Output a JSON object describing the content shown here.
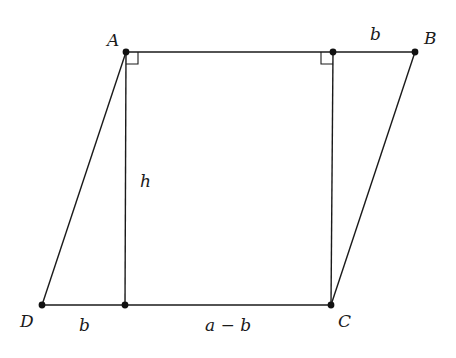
{
  "diagram": {
    "type": "geometry",
    "colors": {
      "stroke": "#1a1a1a",
      "point": "#111111",
      "background": "#ffffff"
    },
    "points": {
      "A": {
        "label": "A",
        "x": 126,
        "y": 52
      },
      "E": {
        "label": "",
        "x": 333,
        "y": 52
      },
      "B": {
        "label": "B",
        "x": 415,
        "y": 52
      },
      "D": {
        "label": "D",
        "x": 42,
        "y": 305
      },
      "F": {
        "label": "",
        "x": 125,
        "y": 305
      },
      "C": {
        "label": "C",
        "x": 331,
        "y": 305
      }
    },
    "segments": [
      [
        "A",
        "E"
      ],
      [
        "E",
        "B"
      ],
      [
        "B",
        "C"
      ],
      [
        "C",
        "F"
      ],
      [
        "F",
        "D"
      ],
      [
        "D",
        "A"
      ],
      [
        "A",
        "F"
      ],
      [
        "E",
        "C"
      ]
    ],
    "right_angles": [
      "A",
      "E"
    ],
    "labels": {
      "A": "A",
      "B": "B",
      "C": "C",
      "D": "D",
      "top_b": "b",
      "bottom_b": "b",
      "h": "h",
      "a_minus_b": "a − b"
    }
  }
}
